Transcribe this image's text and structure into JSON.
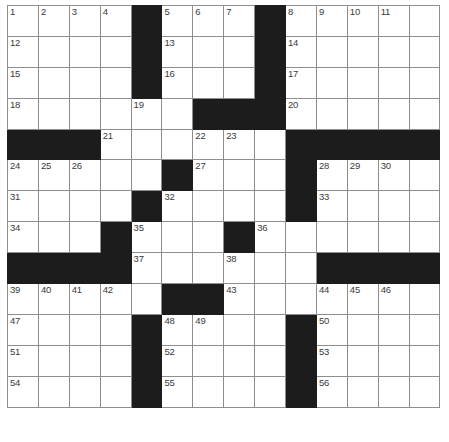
{
  "puzzle": {
    "title": "Crossword Grid",
    "type": "crossword",
    "columns": 14,
    "rows": 14,
    "colors": {
      "block": "#1c1c1c",
      "cell": "#ffffff",
      "grid_line": "#8e8e8e",
      "outer_border": "#4a4a4a",
      "number_text": "#3a3a3a"
    },
    "grid": [
      [
        {
          "block": false,
          "num": "1"
        },
        {
          "block": false,
          "num": "2"
        },
        {
          "block": false,
          "num": "3"
        },
        {
          "block": false,
          "num": "4"
        },
        {
          "block": true,
          "num": ""
        },
        {
          "block": false,
          "num": "5"
        },
        {
          "block": false,
          "num": "6"
        },
        {
          "block": false,
          "num": "7"
        },
        {
          "block": true,
          "num": ""
        },
        {
          "block": false,
          "num": "8"
        },
        {
          "block": false,
          "num": "9"
        },
        {
          "block": false,
          "num": "10"
        },
        {
          "block": false,
          "num": "11"
        },
        {
          "block": false,
          "num": ""
        }
      ],
      [
        {
          "block": false,
          "num": "12"
        },
        {
          "block": false,
          "num": ""
        },
        {
          "block": false,
          "num": ""
        },
        {
          "block": false,
          "num": ""
        },
        {
          "block": true,
          "num": ""
        },
        {
          "block": false,
          "num": "13"
        },
        {
          "block": false,
          "num": ""
        },
        {
          "block": false,
          "num": ""
        },
        {
          "block": true,
          "num": ""
        },
        {
          "block": false,
          "num": "14"
        },
        {
          "block": false,
          "num": ""
        },
        {
          "block": false,
          "num": ""
        },
        {
          "block": false,
          "num": ""
        },
        {
          "block": false,
          "num": ""
        }
      ],
      [
        {
          "block": false,
          "num": "15"
        },
        {
          "block": false,
          "num": ""
        },
        {
          "block": false,
          "num": ""
        },
        {
          "block": false,
          "num": ""
        },
        {
          "block": true,
          "num": ""
        },
        {
          "block": false,
          "num": "16"
        },
        {
          "block": false,
          "num": ""
        },
        {
          "block": false,
          "num": ""
        },
        {
          "block": true,
          "num": ""
        },
        {
          "block": false,
          "num": "17"
        },
        {
          "block": false,
          "num": ""
        },
        {
          "block": false,
          "num": ""
        },
        {
          "block": false,
          "num": ""
        },
        {
          "block": false,
          "num": ""
        }
      ],
      [
        {
          "block": false,
          "num": "18"
        },
        {
          "block": false,
          "num": ""
        },
        {
          "block": false,
          "num": ""
        },
        {
          "block": false,
          "num": ""
        },
        {
          "block": false,
          "num": "19"
        },
        {
          "block": false,
          "num": ""
        },
        {
          "block": true,
          "num": ""
        },
        {
          "block": true,
          "num": ""
        },
        {
          "block": true,
          "num": ""
        },
        {
          "block": false,
          "num": "20"
        },
        {
          "block": false,
          "num": ""
        },
        {
          "block": false,
          "num": ""
        },
        {
          "block": false,
          "num": ""
        },
        {
          "block": false,
          "num": ""
        }
      ],
      [
        {
          "block": true,
          "num": ""
        },
        {
          "block": true,
          "num": ""
        },
        {
          "block": true,
          "num": ""
        },
        {
          "block": false,
          "num": "21"
        },
        {
          "block": false,
          "num": ""
        },
        {
          "block": false,
          "num": ""
        },
        {
          "block": false,
          "num": "22"
        },
        {
          "block": false,
          "num": "23"
        },
        {
          "block": false,
          "num": ""
        },
        {
          "block": true,
          "num": ""
        },
        {
          "block": true,
          "num": ""
        },
        {
          "block": true,
          "num": ""
        },
        {
          "block": true,
          "num": ""
        },
        {
          "block": true,
          "num": ""
        }
      ],
      [
        {
          "block": false,
          "num": "24"
        },
        {
          "block": false,
          "num": "25"
        },
        {
          "block": false,
          "num": "26"
        },
        {
          "block": false,
          "num": ""
        },
        {
          "block": false,
          "num": ""
        },
        {
          "block": true,
          "num": ""
        },
        {
          "block": false,
          "num": "27"
        },
        {
          "block": false,
          "num": ""
        },
        {
          "block": false,
          "num": ""
        },
        {
          "block": true,
          "num": ""
        },
        {
          "block": false,
          "num": "28"
        },
        {
          "block": false,
          "num": "29"
        },
        {
          "block": false,
          "num": "30"
        },
        {
          "block": false,
          "num": ""
        }
      ],
      [
        {
          "block": false,
          "num": "31"
        },
        {
          "block": false,
          "num": ""
        },
        {
          "block": false,
          "num": ""
        },
        {
          "block": false,
          "num": ""
        },
        {
          "block": true,
          "num": ""
        },
        {
          "block": false,
          "num": "32"
        },
        {
          "block": false,
          "num": ""
        },
        {
          "block": false,
          "num": ""
        },
        {
          "block": false,
          "num": ""
        },
        {
          "block": true,
          "num": ""
        },
        {
          "block": false,
          "num": "33"
        },
        {
          "block": false,
          "num": ""
        },
        {
          "block": false,
          "num": ""
        },
        {
          "block": false,
          "num": ""
        }
      ],
      [
        {
          "block": false,
          "num": "34"
        },
        {
          "block": false,
          "num": ""
        },
        {
          "block": false,
          "num": ""
        },
        {
          "block": true,
          "num": ""
        },
        {
          "block": false,
          "num": "35"
        },
        {
          "block": false,
          "num": ""
        },
        {
          "block": false,
          "num": ""
        },
        {
          "block": true,
          "num": ""
        },
        {
          "block": false,
          "num": "36"
        },
        {
          "block": false,
          "num": ""
        },
        {
          "block": false,
          "num": ""
        },
        {
          "block": false,
          "num": ""
        },
        {
          "block": false,
          "num": ""
        },
        {
          "block": false,
          "num": ""
        }
      ],
      [
        {
          "block": true,
          "num": ""
        },
        {
          "block": true,
          "num": ""
        },
        {
          "block": true,
          "num": ""
        },
        {
          "block": true,
          "num": ""
        },
        {
          "block": false,
          "num": "37"
        },
        {
          "block": false,
          "num": ""
        },
        {
          "block": false,
          "num": ""
        },
        {
          "block": false,
          "num": "38"
        },
        {
          "block": false,
          "num": ""
        },
        {
          "block": false,
          "num": ""
        },
        {
          "block": true,
          "num": ""
        },
        {
          "block": true,
          "num": ""
        },
        {
          "block": true,
          "num": ""
        },
        {
          "block": true,
          "num": ""
        }
      ],
      [
        {
          "block": false,
          "num": "39"
        },
        {
          "block": false,
          "num": "40"
        },
        {
          "block": false,
          "num": "41"
        },
        {
          "block": false,
          "num": "42"
        },
        {
          "block": false,
          "num": ""
        },
        {
          "block": true,
          "num": ""
        },
        {
          "block": true,
          "num": ""
        },
        {
          "block": false,
          "num": "43"
        },
        {
          "block": false,
          "num": ""
        },
        {
          "block": false,
          "num": ""
        },
        {
          "block": false,
          "num": "44"
        },
        {
          "block": false,
          "num": "45"
        },
        {
          "block": false,
          "num": "46"
        },
        {
          "block": false,
          "num": ""
        }
      ],
      [
        {
          "block": false,
          "num": "47"
        },
        {
          "block": false,
          "num": ""
        },
        {
          "block": false,
          "num": ""
        },
        {
          "block": false,
          "num": ""
        },
        {
          "block": true,
          "num": ""
        },
        {
          "block": false,
          "num": "48"
        },
        {
          "block": false,
          "num": "49"
        },
        {
          "block": false,
          "num": ""
        },
        {
          "block": false,
          "num": ""
        },
        {
          "block": true,
          "num": ""
        },
        {
          "block": false,
          "num": "50"
        },
        {
          "block": false,
          "num": ""
        },
        {
          "block": false,
          "num": ""
        },
        {
          "block": false,
          "num": ""
        }
      ],
      [
        {
          "block": false,
          "num": "51"
        },
        {
          "block": false,
          "num": ""
        },
        {
          "block": false,
          "num": ""
        },
        {
          "block": false,
          "num": ""
        },
        {
          "block": true,
          "num": ""
        },
        {
          "block": false,
          "num": "52"
        },
        {
          "block": false,
          "num": ""
        },
        {
          "block": false,
          "num": ""
        },
        {
          "block": false,
          "num": ""
        },
        {
          "block": true,
          "num": ""
        },
        {
          "block": false,
          "num": "53"
        },
        {
          "block": false,
          "num": ""
        },
        {
          "block": false,
          "num": ""
        },
        {
          "block": false,
          "num": ""
        }
      ],
      [
        {
          "block": false,
          "num": "54"
        },
        {
          "block": false,
          "num": ""
        },
        {
          "block": false,
          "num": ""
        },
        {
          "block": false,
          "num": ""
        },
        {
          "block": true,
          "num": ""
        },
        {
          "block": false,
          "num": "55"
        },
        {
          "block": false,
          "num": ""
        },
        {
          "block": false,
          "num": ""
        },
        {
          "block": false,
          "num": ""
        },
        {
          "block": true,
          "num": ""
        },
        {
          "block": false,
          "num": "56"
        },
        {
          "block": false,
          "num": ""
        },
        {
          "block": false,
          "num": ""
        },
        {
          "block": false,
          "num": ""
        }
      ]
    ]
  }
}
